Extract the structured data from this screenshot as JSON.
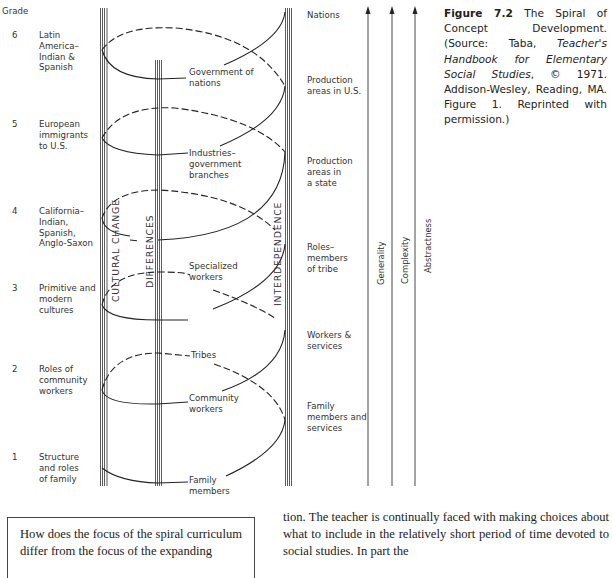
{
  "figure": {
    "grade_header": "Grade",
    "grades": [
      {
        "number": "6",
        "label_lines": [
          "Latin",
          "America–",
          "Indian &",
          "Spanish"
        ]
      },
      {
        "number": "5",
        "label_lines": [
          "European",
          "immigrants",
          "to U.S."
        ]
      },
      {
        "number": "4",
        "label_lines": [
          "California–",
          "Indian,",
          "Spanish,",
          "Anglo-Saxon"
        ]
      },
      {
        "number": "3",
        "label_lines": [
          "Primitive and",
          "modern",
          "cultures"
        ]
      },
      {
        "number": "2",
        "label_lines": [
          "Roles of",
          "community",
          "workers"
        ]
      },
      {
        "number": "1",
        "label_lines": [
          "Structure",
          "and roles",
          "of family"
        ]
      }
    ],
    "column_labels": {
      "cultural_change": "CULTURAL CHANGE",
      "differences": "DIFFERENCES",
      "interdependence": "INTERDEPENDENCE"
    },
    "spiral_labels": [
      {
        "lines": [
          "Government of",
          "nations"
        ]
      },
      {
        "lines": [
          "Industries–",
          "government",
          "branches"
        ]
      },
      {
        "lines": [
          "Specialized",
          "workers"
        ]
      },
      {
        "lines": [
          "Tribes"
        ]
      },
      {
        "lines": [
          "Community",
          "workers"
        ]
      },
      {
        "lines": [
          "Family",
          "members"
        ]
      }
    ],
    "right_labels": [
      {
        "lines": [
          "Nations"
        ]
      },
      {
        "lines": [
          "Production",
          "areas in U.S."
        ]
      },
      {
        "lines": [
          "Production",
          "areas in",
          "a state"
        ]
      },
      {
        "lines": [
          "Roles–",
          "members",
          "of tribe"
        ]
      },
      {
        "lines": [
          "Workers &",
          "services"
        ]
      },
      {
        "lines": [
          "Family",
          "members and",
          "services"
        ]
      }
    ],
    "arrow_labels": [
      "Generality",
      "Complexity",
      "Abstractness"
    ]
  },
  "caption": {
    "figure_label": "Figure 7.2",
    "title": " The Spiral of Concept Development. (Source: Taba, ",
    "book_title": "Teacher's Handbook for Elementary Social Studies",
    "rest": ", © 1971. Addison-Wesley, Reading, MA. Figure 1. Reprinted with permission.)"
  },
  "question_box": {
    "text": "How does the focus of the spiral curriculum differ from the focus of the expanding"
  },
  "body_text": {
    "text": "tion. The teacher is continually faced with making choices about what to include in the relatively short period of time devoted to social studies. In part the"
  }
}
